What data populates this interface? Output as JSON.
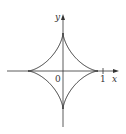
{
  "figure": {
    "axes": {
      "x_label": "x",
      "y_label": "y",
      "origin_label": "0",
      "x_tick_label": "1"
    },
    "colors": {
      "axis": "#333333",
      "curve": "#222222",
      "background": "#ffffff"
    }
  },
  "chart_data": {
    "type": "line",
    "title": "",
    "xlabel": "x",
    "ylabel": "y",
    "equation": "x^(2/3) + y^(2/3) = 1",
    "cusps": [
      [
        1,
        0
      ],
      [
        0,
        1
      ],
      [
        -1,
        0
      ],
      [
        0,
        -1
      ]
    ],
    "ticks": {
      "x": [
        0,
        1
      ]
    },
    "grid": false
  }
}
